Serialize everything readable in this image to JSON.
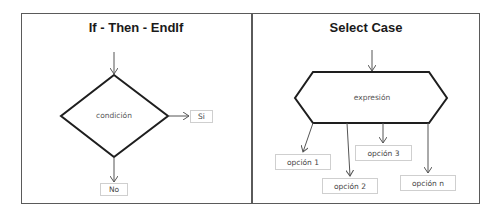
{
  "panels": {
    "left": {
      "title": "If  -  Then  -  EndIf",
      "decision_label": "condición",
      "true_label": "Si",
      "false_label": "No"
    },
    "right": {
      "title": "Select Case",
      "expression_label": "expresión",
      "options": [
        "opción 1",
        "opción 2",
        "opción 3",
        "opción n"
      ]
    }
  },
  "colors": {
    "frame": "#5a5a5a",
    "shape_stroke": "#1e1e1e",
    "arrow": "#555555",
    "box_border": "#cfcfcf"
  }
}
